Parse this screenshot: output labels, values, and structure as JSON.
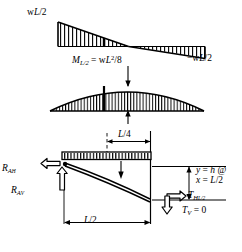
{
  "figure": {
    "ink_color": "#000000",
    "background": "#ffffff"
  },
  "shear_diagram": {
    "name": "shear-diagram",
    "shape": "triangular",
    "left_label": "wL/2",
    "left_label_parts": {
      "w": "w",
      "L": "L",
      "tail": "/2"
    },
    "right_label": "−wL/2",
    "right_label_parts": {
      "lead": "−w",
      "L": "L",
      "tail": "/2"
    },
    "zero_crossing": "midspan",
    "hatch": "vertical",
    "divider_at": "L/4"
  },
  "moment_diagram": {
    "name": "moment-diagram",
    "shape": "parabolic",
    "label": "M_L/2 = wL^2/8",
    "label_parts": {
      "M": "M",
      "M_sub": "L/2",
      "eq": " = w",
      "L": "L",
      "exp": "2",
      "tail": "/8"
    },
    "hatch": "vertical",
    "divider_at": "L/4",
    "max_value_text": "wL²/8"
  },
  "free_body": {
    "name": "cable-free-body",
    "load": {
      "label": "uniform-distributed-load",
      "hatch": "vertical"
    },
    "dimensions": [
      {
        "name": "quarter-span",
        "text": "L/4",
        "parts": {
          "L": "L",
          "tail": "/4"
        }
      },
      {
        "name": "half-span",
        "text": "L/2",
        "parts": {
          "L": "L",
          "tail": "/2"
        }
      }
    ],
    "reactions": [
      {
        "name": "horizontal-reaction",
        "text": "R_A_H",
        "parts": {
          "R": "R",
          "sub": "A",
          "sub2": "H"
        },
        "direction": "left"
      },
      {
        "name": "vertical-reaction",
        "text": "R_A_V",
        "parts": {
          "R": "R",
          "sub": "A",
          "sub2": "V"
        },
        "direction": "up"
      }
    ],
    "tensions": [
      {
        "name": "horizontal-tension-midspan",
        "text": "T_H_L/2",
        "parts": {
          "T": "T",
          "sub": "H",
          "sub2": "L/2"
        },
        "direction": "right"
      },
      {
        "name": "vertical-tension",
        "text": "T_V = 0",
        "parts": {
          "T": "T",
          "sub": "V",
          "tail": " = 0"
        },
        "direction": "down"
      }
    ],
    "sag_annotation": {
      "name": "sag-dimension",
      "line1": "y = h @",
      "line1_parts": {
        "y": "y",
        "eq": " = ",
        "h": "h",
        "at": " @"
      },
      "line2": "x = L/2",
      "line2_parts": {
        "x": "x",
        "eq": " = ",
        "L": "L",
        "tail": "/2"
      }
    }
  }
}
